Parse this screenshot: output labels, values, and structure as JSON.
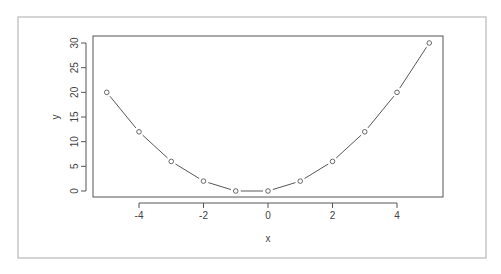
{
  "chart_data": {
    "type": "line",
    "title": "",
    "xlabel": "x",
    "ylabel": "y",
    "x": [
      -5,
      -4,
      -3,
      -2,
      -1,
      0,
      1,
      2,
      3,
      4,
      5
    ],
    "series": [
      {
        "name": "y",
        "values": [
          20,
          12,
          6,
          2,
          0,
          0,
          2,
          6,
          12,
          20,
          30
        ],
        "style": "points-and-lines",
        "marker": "open-circle",
        "color": "#444444"
      }
    ],
    "x_ticks": [
      -4,
      -2,
      0,
      2,
      4
    ],
    "x_tick_labels": [
      "-4",
      "-2",
      "0",
      "2",
      "4"
    ],
    "y_ticks": [
      0,
      5,
      10,
      15,
      20,
      25,
      30
    ],
    "y_tick_labels": [
      "0",
      "5",
      "10",
      "15",
      "20",
      "25",
      "30"
    ],
    "xlim": [
      -5.3,
      5.3
    ],
    "ylim": [
      -1.2,
      31.2
    ],
    "grid": false,
    "legend": null
  },
  "colors": {
    "frame": "#b9b9b9",
    "axis": "#555555",
    "series": "#444444",
    "background": "#ffffff"
  }
}
